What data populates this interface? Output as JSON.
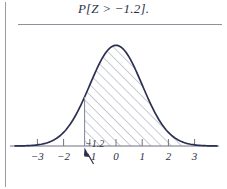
{
  "figure": {
    "title": "P[Z > −1.2].",
    "callout": "−1.2",
    "curve_color": "#2b3052",
    "hatch_color": "#8b8fa6",
    "axis_color": "#6f7280",
    "rule_color": "#8f909c",
    "background": "#ffffff"
  },
  "chart_data": {
    "type": "area",
    "title": "P[Z > −1.2].",
    "xlabel": "",
    "ylabel": "",
    "xlim": [
      -3.6,
      3.6
    ],
    "ylim": [
      0,
      0.42
    ],
    "grid": false,
    "legend": null,
    "curve": "standard normal density",
    "xticks": [
      -3,
      -2,
      -1,
      0,
      1,
      2,
      3
    ],
    "xticklabels": [
      "−3",
      "−2",
      "−1",
      "0",
      "1",
      "2",
      "3"
    ],
    "shaded_region": {
      "from": -1.2,
      "to": 3.6,
      "style": "diagonal-hatch",
      "boundary_line_at": -1.2
    },
    "annotations": [
      {
        "text": "−1.2",
        "x": -1.2,
        "y": 0,
        "style": "arrow-pointing-up-left-to-axis"
      }
    ],
    "x": [
      -3.6,
      -3.4,
      -3.2,
      -3.0,
      -2.8,
      -2.6,
      -2.4,
      -2.2,
      -2.0,
      -1.8,
      -1.6,
      -1.4,
      -1.2,
      -1.0,
      -0.8,
      -0.6,
      -0.4,
      -0.2,
      0.0,
      0.2,
      0.4,
      0.6,
      0.8,
      1.0,
      1.2,
      1.4,
      1.6,
      1.8,
      2.0,
      2.2,
      2.4,
      2.6,
      2.8,
      3.0,
      3.2,
      3.4,
      3.6
    ],
    "y": [
      0.0006,
      0.0012,
      0.0024,
      0.0044,
      0.0079,
      0.0136,
      0.0224,
      0.0355,
      0.054,
      0.079,
      0.1109,
      0.1497,
      0.1942,
      0.242,
      0.2897,
      0.3332,
      0.3683,
      0.391,
      0.3989,
      0.391,
      0.3683,
      0.3332,
      0.2897,
      0.242,
      0.1942,
      0.1497,
      0.1109,
      0.079,
      0.054,
      0.0355,
      0.0224,
      0.0136,
      0.0079,
      0.0044,
      0.0024,
      0.0012,
      0.0006
    ]
  }
}
